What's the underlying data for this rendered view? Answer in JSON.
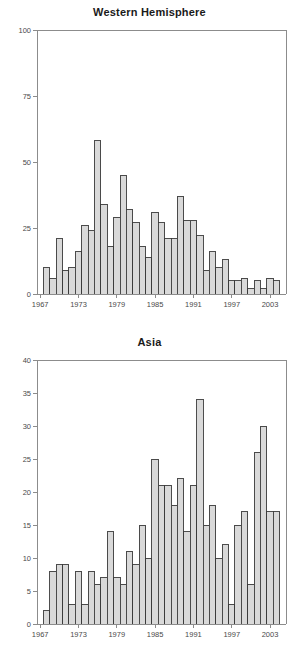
{
  "figure": {
    "background_color": "#ffffff",
    "bar_fill_color": "#d9d9d9",
    "bar_edge_color": "#3a3a3a",
    "axis_color": "#8c8c8c",
    "text_color": "#2b2b2b"
  },
  "chart_data": [
    {
      "type": "bar",
      "title": "Western Hemisphere",
      "xlabel": "",
      "ylabel": "",
      "xlim": [
        1966.5,
        2005.5
      ],
      "ylim": [
        0,
        100
      ],
      "grid": false,
      "legend": null,
      "ytick_labels": [
        "0",
        "25",
        "50",
        "75",
        "100"
      ],
      "ytick_values": [
        0,
        25,
        50,
        75,
        100
      ],
      "xtick_labels": [
        "1967",
        "1973",
        "1979",
        "1985",
        "1991",
        "1997",
        "2003"
      ],
      "xtick_values": [
        1967,
        1973,
        1979,
        1985,
        1991,
        1997,
        2003
      ],
      "categories": [
        1968,
        1969,
        1970,
        1971,
        1972,
        1973,
        1974,
        1975,
        1976,
        1977,
        1978,
        1979,
        1980,
        1981,
        1982,
        1983,
        1984,
        1985,
        1986,
        1987,
        1988,
        1989,
        1990,
        1991,
        1992,
        1993,
        1994,
        1995,
        1996,
        1997,
        1998,
        1999,
        2000,
        2001,
        2002,
        2003,
        2004
      ],
      "values": [
        10,
        6,
        21,
        9,
        10,
        16,
        26,
        24,
        58,
        34,
        18,
        29,
        45,
        32,
        27,
        18,
        14,
        31,
        27,
        21,
        21,
        37,
        28,
        28,
        22,
        9,
        16,
        10,
        13,
        5,
        5,
        6,
        2,
        5,
        2,
        6,
        5
      ]
    },
    {
      "type": "bar",
      "title": "Asia",
      "xlabel": "",
      "ylabel": "",
      "xlim": [
        1966.5,
        2005.5
      ],
      "ylim": [
        0,
        40
      ],
      "grid": false,
      "legend": null,
      "ytick_labels": [
        "0",
        "5",
        "10",
        "15",
        "20",
        "25",
        "30",
        "35",
        "40"
      ],
      "ytick_values": [
        0,
        5,
        10,
        15,
        20,
        25,
        30,
        35,
        40
      ],
      "xtick_labels": [
        "1967",
        "1973",
        "1979",
        "1985",
        "1991",
        "1997",
        "2003"
      ],
      "xtick_values": [
        1967,
        1973,
        1979,
        1985,
        1991,
        1997,
        2003
      ],
      "categories": [
        1968,
        1969,
        1970,
        1971,
        1972,
        1973,
        1974,
        1975,
        1976,
        1977,
        1978,
        1979,
        1980,
        1981,
        1982,
        1983,
        1984,
        1985,
        1986,
        1987,
        1988,
        1989,
        1990,
        1991,
        1992,
        1993,
        1994,
        1995,
        1996,
        1997,
        1998,
        1999,
        2000,
        2001,
        2002,
        2003,
        2004
      ],
      "values": [
        2,
        8,
        9,
        9,
        3,
        8,
        3,
        8,
        6,
        7,
        14,
        7,
        6,
        11,
        9,
        15,
        10,
        25,
        21,
        21,
        18,
        22,
        14,
        21,
        34,
        15,
        18,
        10,
        12,
        3,
        15,
        17,
        6,
        26,
        30,
        17,
        17
      ]
    }
  ]
}
